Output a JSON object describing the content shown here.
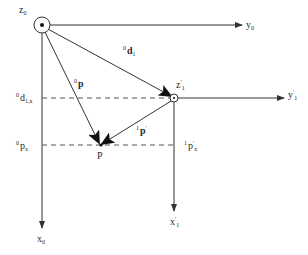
{
  "diagram": {
    "title": "",
    "frames": {
      "frame0": {
        "origin_label": "z",
        "origin_sub": "0",
        "y_axis_label": "y",
        "y_axis_sub": "0",
        "x_axis_label": "x",
        "x_axis_sub": "0"
      },
      "frame1": {
        "origin_label": "z",
        "origin_prime": "′",
        "origin_sub": "1",
        "y_axis_label": "y",
        "y_axis_prime": "′",
        "y_axis_sub": "1",
        "x_axis_label": "x",
        "x_axis_prime": "′",
        "x_axis_sub": "1"
      }
    },
    "vectors": {
      "d1": {
        "pre": "0",
        "label": "d",
        "sub": "1"
      },
      "p0": {
        "pre": "0",
        "label": "p"
      },
      "p1": {
        "pre": "1",
        "label": "p",
        "prime": "′"
      }
    },
    "point": {
      "label": "P"
    },
    "projections": {
      "d1x": {
        "pre": "0",
        "label": "d",
        "sub": "1,x"
      },
      "px": {
        "pre": "0",
        "label": "p",
        "sub": "x"
      },
      "p1x": {
        "pre": "1",
        "label": "p",
        "prime": "′",
        "sub": "x"
      }
    },
    "colors": {
      "line": "#333333",
      "dash": "#555555",
      "background": "#ffffff"
    }
  }
}
